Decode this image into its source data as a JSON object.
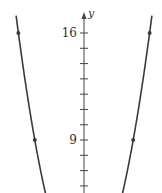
{
  "chart_data": {
    "type": "line",
    "title": "",
    "function": "y = x^2",
    "xlabel": "",
    "ylabel": "y",
    "ylim": [
      5.5,
      17.1
    ],
    "xlim": [
      -4.15,
      4.15
    ],
    "y_tick_labels": [
      {
        "value": 16,
        "label": "16"
      },
      {
        "value": 9,
        "label": "9"
      }
    ],
    "y_ticks": [
      6,
      7,
      8,
      9,
      10,
      11,
      12,
      13,
      14,
      15,
      16
    ],
    "marked_points": [
      {
        "x": -4,
        "y": 16
      },
      {
        "x": 4,
        "y": 16
      },
      {
        "x": -3,
        "y": 9
      },
      {
        "x": 3,
        "y": 9
      }
    ],
    "series": [
      {
        "name": "y = x^2",
        "color": "#3a3a3a"
      }
    ],
    "grid": false,
    "legend": null
  },
  "colors": {
    "curve": "#3a3a3a",
    "axis": "#444444",
    "background": "#ffffff"
  }
}
